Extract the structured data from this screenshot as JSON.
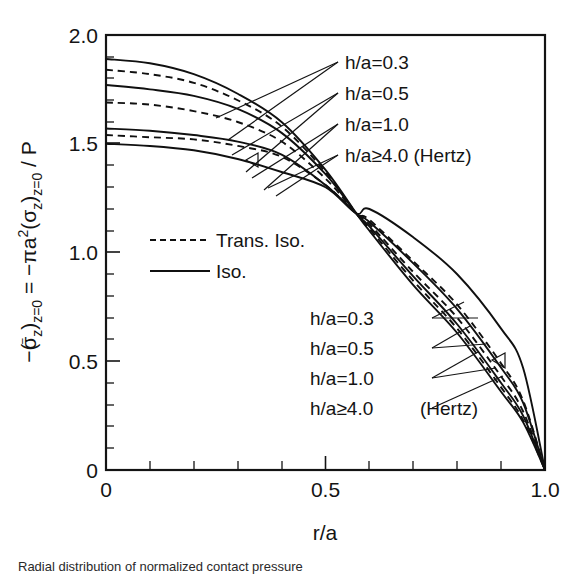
{
  "figure": {
    "caption": "Radial distribution of normalized contact pressure"
  },
  "axes": {
    "x": {
      "title": "r/a",
      "ticks": [
        "0",
        "0.5",
        "1.0"
      ],
      "tick_values": [
        0,
        0.5,
        1.0
      ],
      "range": [
        0,
        1.0
      ],
      "minor_step": 0.1
    },
    "y": {
      "title_parts": {
        "p1": "−(",
        "sigma_bar": "σ",
        "sub_z1": "z",
        "p2": ")",
        "sub_eq1": "z=0",
        "eq": " = −",
        "pi_a": "πa",
        "sup2": "2",
        "p3": "(",
        "sigma2": "σ",
        "sub_z2": "z",
        "p4": ")",
        "sub_eq2": "z=0",
        "p5": " / P"
      },
      "title_plain": "−(σ̄z)z=0 = −πa²(σz)z=0 / P",
      "ticks": [
        "0",
        "0.5",
        "1.0",
        "1.5",
        "2.0"
      ],
      "tick_values": [
        0,
        0.5,
        1.0,
        1.5,
        2.0
      ],
      "range": [
        0,
        2.0
      ],
      "minor_step": 0.1
    }
  },
  "legend": {
    "position": "center-left",
    "entries": [
      {
        "label": "Trans. Iso.",
        "style": "dashed"
      },
      {
        "label": "Iso.",
        "style": "solid"
      }
    ]
  },
  "annotations": {
    "upper_group": [
      {
        "label": "h/a=0.3"
      },
      {
        "label": "h/a=0.5"
      },
      {
        "label": "h/a=1.0"
      },
      {
        "label": "h/a≥4.0 (Hertz)"
      }
    ],
    "lower_group": [
      {
        "label": "h/a=0.3"
      },
      {
        "label": "h/a=0.5"
      },
      {
        "label": "h/a=1.0"
      },
      {
        "label": "h/a≥4.0"
      },
      {
        "label": "(Hertz)"
      }
    ]
  },
  "colors": {
    "ink": "#101010",
    "background": "#ffffff"
  },
  "chart_data": {
    "type": "line",
    "title": "",
    "xlabel": "r/a",
    "ylabel": "−(σ̄z)z=0 = −πa²(σz)z=0 / P",
    "xlim": [
      0,
      1.0
    ],
    "ylim": [
      0,
      2.0
    ],
    "grid": false,
    "legend_position": "center-left",
    "x": [
      0,
      0.1,
      0.2,
      0.3,
      0.4,
      0.5,
      0.57,
      0.6,
      0.7,
      0.8,
      0.9,
      0.95,
      1.0
    ],
    "series": [
      {
        "name": "h/a=0.3 Iso.",
        "style": "solid",
        "material": "Iso.",
        "h_over_a": "0.3",
        "values": [
          1.89,
          1.87,
          1.82,
          1.73,
          1.6,
          1.38,
          1.18,
          1.1,
          0.85,
          0.63,
          0.36,
          0.22,
          0.0
        ]
      },
      {
        "name": "h/a=0.3 Trans. Iso.",
        "style": "dashed",
        "material": "Trans. Iso.",
        "h_over_a": "0.3",
        "values": [
          1.84,
          1.82,
          1.78,
          1.7,
          1.58,
          1.37,
          1.18,
          1.11,
          0.87,
          0.65,
          0.38,
          0.23,
          0.0
        ]
      },
      {
        "name": "h/a=0.5 Iso.",
        "style": "solid",
        "material": "Iso.",
        "h_over_a": "0.5",
        "values": [
          1.77,
          1.75,
          1.72,
          1.66,
          1.55,
          1.36,
          1.18,
          1.12,
          0.89,
          0.67,
          0.4,
          0.25,
          0.0
        ]
      },
      {
        "name": "h/a=0.5 Trans. Iso.",
        "style": "dashed",
        "material": "Trans. Iso.",
        "h_over_a": "0.5",
        "values": [
          1.69,
          1.68,
          1.65,
          1.6,
          1.51,
          1.34,
          1.18,
          1.13,
          0.91,
          0.7,
          0.43,
          0.27,
          0.0
        ]
      },
      {
        "name": "h/a=1.0 Iso.",
        "style": "solid",
        "material": "Iso.",
        "h_over_a": "1.0",
        "values": [
          1.57,
          1.56,
          1.54,
          1.51,
          1.45,
          1.31,
          1.18,
          1.14,
          0.95,
          0.74,
          0.47,
          0.31,
          0.0
        ]
      },
      {
        "name": "h/a=1.0 Trans. Iso.",
        "style": "dashed",
        "material": "Trans. Iso.",
        "h_over_a": "1.0",
        "values": [
          1.54,
          1.53,
          1.52,
          1.49,
          1.44,
          1.31,
          1.18,
          1.15,
          0.96,
          0.76,
          0.49,
          0.32,
          0.0
        ]
      },
      {
        "name": "h/a≥4.0 (Hertz)",
        "style": "solid",
        "material": "Iso.",
        "h_over_a": "≥4.0",
        "values": [
          1.5,
          1.49,
          1.47,
          1.43,
          1.37,
          1.3,
          1.18,
          1.2,
          1.07,
          0.9,
          0.65,
          0.47,
          0.0
        ]
      }
    ]
  }
}
